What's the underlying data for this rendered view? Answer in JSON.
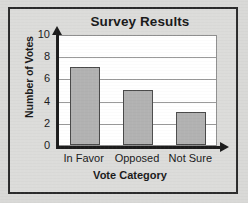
{
  "chart_data": {
    "type": "bar",
    "title": "Survey Results",
    "xlabel": "Vote Category",
    "ylabel": "Number of Votes",
    "categories": [
      "In Favor",
      "Opposed",
      "Not Sure"
    ],
    "values": [
      7,
      5,
      3
    ],
    "ylim": [
      0,
      10
    ],
    "yticks": [
      0,
      2,
      4,
      6,
      8,
      10
    ],
    "ytick_labels": [
      "0",
      "2",
      "4",
      "6",
      "8",
      "10"
    ],
    "grid": "horizontal",
    "legend": "none",
    "bar_color": "#b2b2b2",
    "bar_edge_color": "#4a4a4a",
    "axis_color": "#1c1c1c",
    "gridline_color": "#9a9a9a",
    "plot_background": "#ffffff",
    "figure_background": "#dcdcda",
    "frame_color": "#2b2b2b"
  }
}
